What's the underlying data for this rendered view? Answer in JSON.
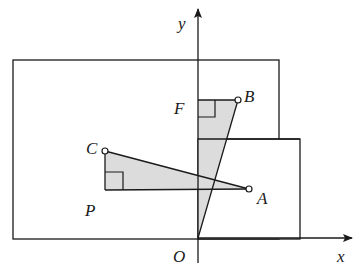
{
  "diagram": {
    "colors": {
      "stroke": "#1a1a1a",
      "fill": "#dcdcdc",
      "background": "#ffffff"
    },
    "axes": {
      "x_label": "x",
      "y_label": "y",
      "origin_label": "O"
    },
    "points": {
      "A": "A",
      "B": "B",
      "C": "C",
      "F": "F",
      "P": "P"
    },
    "shapes": [
      "outer rectangle",
      "inner rectangle",
      "triangle CPA (right angle at P)",
      "triangle OFB (right angle at F)"
    ]
  }
}
